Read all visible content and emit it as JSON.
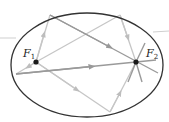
{
  "diagram": {
    "foci": [
      {
        "label": "F",
        "subscript": "1",
        "x": 36,
        "y": 62
      },
      {
        "label": "F",
        "subscript": "2",
        "x": 136,
        "y": 62
      }
    ],
    "ellipse": {
      "cx": 87,
      "cy": 65,
      "rx": 76,
      "ry": 52,
      "stroke": "#333333"
    },
    "colors": {
      "ray_light": "#c8c8c8",
      "ray_mid": "#a8a8a8",
      "ray_dark": "#808080",
      "focus_dot": "#1a1a1a",
      "outline": "#333333"
    }
  }
}
